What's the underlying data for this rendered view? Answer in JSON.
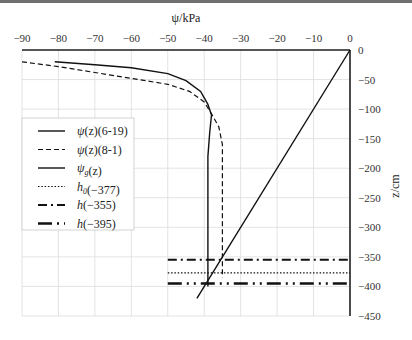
{
  "chart_data": {
    "type": "line",
    "title": "",
    "xlabel": "ψ/kPa",
    "ylabel": "z/cm",
    "xlim": [
      -90,
      0
    ],
    "ylim": [
      -450,
      0
    ],
    "x_ticks": [
      -90,
      -80,
      -70,
      -60,
      -50,
      -40,
      -30,
      -20,
      -10,
      0
    ],
    "y_ticks": [
      0,
      -50,
      -100,
      -150,
      -200,
      -250,
      -300,
      -350,
      -400,
      -450
    ],
    "grid": true,
    "x_axis_position": "top",
    "y_axis_position": "right",
    "legend_position": "left-middle",
    "series": [
      {
        "name": "ψ(z)(6-19)",
        "style": "solid",
        "width": 1.4,
        "points": [
          [
            -81,
            -20
          ],
          [
            -70,
            -25
          ],
          [
            -60,
            -30
          ],
          [
            -50,
            -40
          ],
          [
            -45,
            -52
          ],
          [
            -41,
            -70
          ],
          [
            -39,
            -92
          ],
          [
            -38,
            -110
          ],
          [
            -38.5,
            -140
          ],
          [
            -39,
            -180
          ],
          [
            -39,
            -250
          ],
          [
            -39,
            -320
          ],
          [
            -39,
            -400
          ]
        ]
      },
      {
        "name": "ψ(z)(8-1)",
        "style": "dashed",
        "width": 1.2,
        "points": [
          [
            -90,
            -20
          ],
          [
            -80,
            -28
          ],
          [
            -70,
            -38
          ],
          [
            -60,
            -48
          ],
          [
            -50,
            -58
          ],
          [
            -44,
            -70
          ],
          [
            -40,
            -88
          ],
          [
            -38,
            -108
          ],
          [
            -36,
            -130
          ],
          [
            -35,
            -160
          ],
          [
            -35,
            -220
          ],
          [
            -35,
            -300
          ],
          [
            -35,
            -370
          ],
          [
            -35,
            -385
          ]
        ]
      },
      {
        "name": "ψ_g(z)",
        "style": "solid",
        "width": 1.4,
        "points": [
          [
            0,
            0
          ],
          [
            -42,
            -420
          ]
        ]
      },
      {
        "name": "h_0(−377)",
        "style": "dotted",
        "width": 1.2,
        "points": [
          [
            -50,
            -377
          ],
          [
            0,
            -377
          ]
        ]
      },
      {
        "name": "h(−355)",
        "style": "dashdot",
        "width": 2,
        "points": [
          [
            -50,
            -355
          ],
          [
            0,
            -355
          ]
        ]
      },
      {
        "name": "h(−395)",
        "style": "longdashdotdot",
        "width": 2.4,
        "points": [
          [
            -50,
            -395
          ],
          [
            0,
            -395
          ]
        ]
      }
    ],
    "legend": [
      {
        "label_main": "ψ",
        "label_sub": "",
        "label_rest": "(z)(6-19)"
      },
      {
        "label_main": "ψ",
        "label_sub": "",
        "label_rest": "(z)(8-1)"
      },
      {
        "label_main": "ψ",
        "label_sub": "g",
        "label_rest": "(z)"
      },
      {
        "label_main": "h",
        "label_sub": "0",
        "label_rest": "(−377)"
      },
      {
        "label_main": "h",
        "label_sub": "",
        "label_rest": "(−355)"
      },
      {
        "label_main": "h",
        "label_sub": "",
        "label_rest": "(−395)"
      }
    ]
  }
}
